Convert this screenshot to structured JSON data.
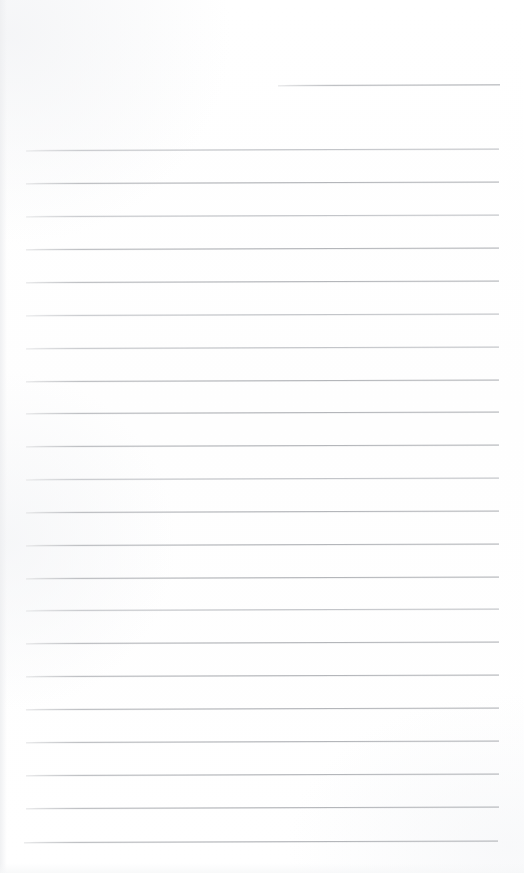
{
  "page": {
    "type": "scanned-blank-ruled-paper",
    "width": 524,
    "height": 873,
    "background_color": "#ffffff",
    "rule_color": "#b4b6ba",
    "rule_color_faint": "#c3c5c9",
    "rule_thickness_px": 1,
    "content_text": "",
    "notes_written": "none"
  },
  "ruling": {
    "left_margin_px": 26,
    "right_edge_px": 499,
    "line_spacing_px": 33,
    "line_count": 23,
    "first_full_line_y": 150,
    "last_line_y": 842,
    "slant_deg": -0.18
  },
  "lines": [
    {
      "id": "line-header-rule",
      "y": 85,
      "x1": 278,
      "x2": 500,
      "shade": "normal",
      "label": "header-rule"
    },
    {
      "id": "line-1",
      "y": 150,
      "x1": 26,
      "x2": 499,
      "shade": "faint",
      "label": "rule-1"
    },
    {
      "id": "line-2",
      "y": 183,
      "x1": 26,
      "x2": 499,
      "shade": "normal",
      "label": "rule-2"
    },
    {
      "id": "line-3",
      "y": 216,
      "x1": 26,
      "x2": 499,
      "shade": "faint",
      "label": "rule-3"
    },
    {
      "id": "line-4",
      "y": 249,
      "x1": 26,
      "x2": 499,
      "shade": "normal",
      "label": "rule-4"
    },
    {
      "id": "line-5",
      "y": 282,
      "x1": 26,
      "x2": 499,
      "shade": "normal",
      "label": "rule-5"
    },
    {
      "id": "line-6",
      "y": 315,
      "x1": 26,
      "x2": 499,
      "shade": "faint",
      "label": "rule-6"
    },
    {
      "id": "line-7",
      "y": 348,
      "x1": 26,
      "x2": 499,
      "shade": "faint",
      "label": "rule-7"
    },
    {
      "id": "line-8",
      "y": 381,
      "x1": 26,
      "x2": 499,
      "shade": "normal",
      "label": "rule-8"
    },
    {
      "id": "line-9",
      "y": 413,
      "x1": 26,
      "x2": 499,
      "shade": "normal",
      "label": "rule-9"
    },
    {
      "id": "line-10",
      "y": 446,
      "x1": 26,
      "x2": 499,
      "shade": "normal",
      "label": "rule-10"
    },
    {
      "id": "line-11",
      "y": 479,
      "x1": 26,
      "x2": 499,
      "shade": "faint",
      "label": "rule-11"
    },
    {
      "id": "line-12",
      "y": 512,
      "x1": 26,
      "x2": 499,
      "shade": "normal",
      "label": "rule-12"
    },
    {
      "id": "line-13",
      "y": 545,
      "x1": 26,
      "x2": 499,
      "shade": "normal",
      "label": "rule-13"
    },
    {
      "id": "line-14",
      "y": 578,
      "x1": 26,
      "x2": 499,
      "shade": "normal",
      "label": "rule-14"
    },
    {
      "id": "line-15",
      "y": 610,
      "x1": 26,
      "x2": 499,
      "shade": "faint",
      "label": "rule-15"
    },
    {
      "id": "line-16",
      "y": 643,
      "x1": 26,
      "x2": 499,
      "shade": "normal",
      "label": "rule-16"
    },
    {
      "id": "line-17",
      "y": 676,
      "x1": 26,
      "x2": 499,
      "shade": "normal",
      "label": "rule-17"
    },
    {
      "id": "line-18",
      "y": 709,
      "x1": 26,
      "x2": 499,
      "shade": "normal",
      "label": "rule-18"
    },
    {
      "id": "line-19",
      "y": 742,
      "x1": 26,
      "x2": 499,
      "shade": "normal",
      "label": "rule-19"
    },
    {
      "id": "line-20",
      "y": 775,
      "x1": 26,
      "x2": 499,
      "shade": "normal",
      "label": "rule-20"
    },
    {
      "id": "line-21",
      "y": 808,
      "x1": 26,
      "x2": 499,
      "shade": "normal",
      "label": "rule-21"
    },
    {
      "id": "line-22",
      "y": 842,
      "x1": 24,
      "x2": 498,
      "shade": "normal",
      "label": "rule-22"
    }
  ]
}
